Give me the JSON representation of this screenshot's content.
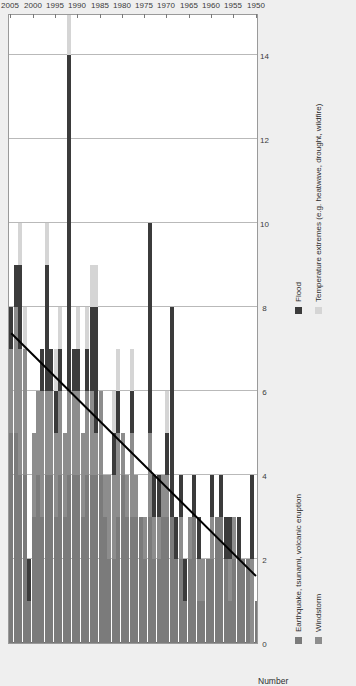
{
  "figure": {
    "value_axis_title": "Number",
    "value_ticks": [
      0,
      2,
      4,
      6,
      8,
      10,
      12,
      14
    ],
    "year_ticks": [
      1950,
      1955,
      1960,
      1965,
      1970,
      1975,
      1980,
      1985,
      1990,
      1995,
      2000,
      2005
    ]
  },
  "legend": {
    "items": [
      {
        "label": "Earthquake, tsunami, volcanic eruption",
        "color": "#7b7b7b",
        "key": "quake"
      },
      {
        "label": "Flood",
        "color": "#3b3b3b",
        "key": "flood"
      },
      {
        "label": "Windstorm",
        "color": "#8d8d8d",
        "key": "wind"
      },
      {
        "label": "Temperature extremes (e.g. heatwave, drought, wildfire)",
        "color": "#d5d5d5",
        "key": "temp"
      }
    ]
  },
  "chart_data": {
    "type": "bar",
    "orientation": "horizontal-stacked",
    "title": "",
    "xlabel": "Number",
    "ylabel": "",
    "xlim": [
      0,
      15
    ],
    "grid": true,
    "legend_position": "below",
    "categories": [
      1950,
      1951,
      1952,
      1953,
      1954,
      1955,
      1956,
      1957,
      1958,
      1959,
      1960,
      1961,
      1962,
      1963,
      1964,
      1965,
      1966,
      1967,
      1968,
      1969,
      1970,
      1971,
      1972,
      1973,
      1974,
      1975,
      1976,
      1977,
      1978,
      1979,
      1980,
      1981,
      1982,
      1983,
      1984,
      1985,
      1986,
      1987,
      1988,
      1989,
      1990,
      1991,
      1992,
      1993,
      1994,
      1995,
      1996,
      1997,
      1998,
      1999,
      2000,
      2001,
      2002,
      2003,
      2004,
      2005
    ],
    "series": [
      {
        "name": "Earthquake, tsunami, volcanic eruption",
        "color": "#7b7b7b",
        "values": [
          1,
          0,
          2,
          2,
          2,
          2,
          1,
          2,
          3,
          3,
          2,
          2,
          1,
          1,
          3,
          2,
          1,
          2,
          2,
          3,
          3,
          3,
          2,
          2,
          3,
          2,
          3,
          3,
          3,
          3,
          4,
          3,
          2,
          2,
          3,
          4,
          4,
          4,
          4,
          3,
          4,
          4,
          4,
          3,
          4,
          3,
          4,
          4,
          3,
          4,
          3,
          1,
          4,
          4,
          5,
          5
        ]
      },
      {
        "name": "Windstorm",
        "color": "#8d8d8d",
        "values": [
          0,
          2,
          0,
          0,
          0,
          1,
          1,
          0,
          0,
          0,
          1,
          0,
          1,
          1,
          0,
          1,
          0,
          1,
          0,
          0,
          1,
          1,
          1,
          1,
          2,
          1,
          0,
          1,
          2,
          1,
          1,
          2,
          2,
          2,
          1,
          2,
          1,
          2,
          2,
          2,
          2,
          2,
          2,
          2,
          2,
          2,
          2,
          2,
          3,
          2,
          2,
          0,
          3,
          3,
          3,
          2
        ]
      },
      {
        "name": "Flood",
        "color": "#3b3b3b",
        "values": [
          0,
          2,
          0,
          0,
          1,
          0,
          1,
          1,
          1,
          0,
          1,
          0,
          0,
          1,
          1,
          0,
          1,
          1,
          1,
          5,
          1,
          0,
          1,
          1,
          5,
          0,
          0,
          0,
          1,
          0,
          0,
          1,
          1,
          0,
          0,
          0,
          3,
          2,
          1,
          0,
          1,
          1,
          8,
          0,
          1,
          1,
          1,
          3,
          1,
          0,
          0,
          1,
          0,
          2,
          1,
          1
        ]
      },
      {
        "name": "Temperature extremes (e.g. heatwave, drought, wildfire)",
        "color": "#d5d5d5",
        "values": [
          0,
          0,
          0,
          0,
          0,
          0,
          0,
          0,
          0,
          0,
          0,
          0,
          0,
          0,
          0,
          0,
          0,
          0,
          0,
          0,
          1,
          0,
          0,
          0,
          0,
          0,
          0,
          0,
          1,
          0,
          0,
          1,
          1,
          0,
          0,
          0,
          1,
          1,
          1,
          0,
          1,
          0,
          1,
          0,
          1,
          1,
          0,
          1,
          0,
          0,
          0,
          0,
          1,
          1,
          0,
          0
        ]
      }
    ],
    "trend_line": {
      "name": "trend",
      "color": "#000000",
      "start": {
        "year": 1950,
        "value": 1.6
      },
      "end": {
        "year": 2005,
        "value": 7.4
      }
    }
  }
}
